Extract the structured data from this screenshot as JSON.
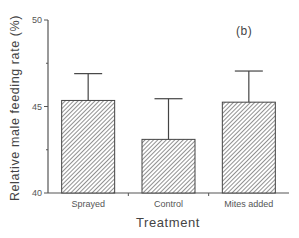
{
  "chart_data": {
    "type": "bar",
    "title": "",
    "panel_label": "(b)",
    "xlabel": "Treatment",
    "ylabel": "Relative male feeding rate (%)",
    "categories": [
      "Sprayed",
      "Control",
      "Mites added"
    ],
    "values": [
      45.35,
      43.1,
      45.25
    ],
    "error_upper": [
      46.9,
      45.45,
      47.05
    ],
    "ylim": [
      40,
      50
    ],
    "yticks": [
      40,
      45,
      50
    ],
    "grid": false,
    "legend": null,
    "bar_fill": "diagonal hatch",
    "colors": {
      "axis": "#555555",
      "bar_stroke": "#444444",
      "hatch": "#555555"
    }
  }
}
